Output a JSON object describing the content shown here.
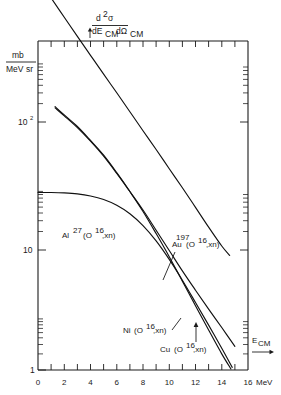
{
  "chart_data": {
    "type": "line",
    "title": "",
    "ylabel_numerator": "d²σ",
    "ylabel_denominator": "dE_CM dΩ_CM",
    "yunit_numerator": "mb",
    "yunit_denominator": "MeV·sr",
    "xlabel": "E_CM",
    "xunit": "MeV",
    "xlim": [
      0,
      16
    ],
    "ylim": [
      1,
      1000
    ],
    "yscale": "log",
    "xscale": "linear",
    "grid": false,
    "legend_position": "inline-annotations",
    "xticks_major": [
      0,
      2,
      4,
      6,
      8,
      10,
      12,
      14,
      16
    ],
    "xticks_minor": [
      1,
      3,
      5,
      7,
      9,
      11,
      13,
      15
    ],
    "xtick_labels": [
      "0",
      "2",
      "4",
      "6",
      "8",
      "10",
      "12",
      "14",
      "16"
    ],
    "ytick_labels": [
      "1",
      "10",
      "10²"
    ],
    "ytick_values": [
      1,
      10,
      100
    ],
    "series": [
      {
        "name": "Au197(O16,xn)",
        "label_base": "Au",
        "label_sup_pre": "197",
        "label_rest": "(O",
        "label_sup_mid": "16",
        "label_tail": ",xn)",
        "points": [
          [
            1.0,
            1000
          ],
          [
            2.0,
            700
          ],
          [
            3.0,
            490
          ],
          [
            4.0,
            345
          ],
          [
            5.0,
            243
          ],
          [
            6.0,
            172
          ],
          [
            7.0,
            121
          ],
          [
            8.0,
            85
          ],
          [
            9.0,
            60
          ],
          [
            10.0,
            42
          ],
          [
            11.0,
            29.5
          ],
          [
            12.0,
            20.5
          ],
          [
            13.0,
            14.2
          ],
          [
            14.0,
            10.0
          ],
          [
            14.6,
            8.4
          ]
        ]
      },
      {
        "name": "Al27(O16,xn)",
        "label_base": "Al",
        "label_sup_pre": "27",
        "label_rest": "(O",
        "label_sup_mid": "16",
        "label_tail": ",xn)",
        "points": [
          [
            0.0,
            27.0
          ],
          [
            1.0,
            27.0
          ],
          [
            2.0,
            26.8
          ],
          [
            3.0,
            26.3
          ],
          [
            4.0,
            25.3
          ],
          [
            5.0,
            23.7
          ],
          [
            6.0,
            21.3
          ],
          [
            7.0,
            18.2
          ],
          [
            8.0,
            14.6
          ],
          [
            9.0,
            11.0
          ],
          [
            10.0,
            7.8
          ],
          [
            11.0,
            5.3
          ],
          [
            12.0,
            3.5
          ],
          [
            13.0,
            2.3
          ],
          [
            14.0,
            1.5
          ],
          [
            14.8,
            1.05
          ]
        ]
      },
      {
        "name": "Ni(O16,xn)",
        "label_base": "Ni",
        "label_sup_pre": "",
        "label_rest": "(O",
        "label_sup_mid": "16",
        "label_tail": ",xn)",
        "points": [
          [
            1.3,
            133
          ],
          [
            2.0,
            114
          ],
          [
            3.0,
            92
          ],
          [
            4.0,
            71
          ],
          [
            5.0,
            54
          ],
          [
            6.0,
            39
          ],
          [
            7.0,
            27.5
          ],
          [
            8.0,
            19.0
          ],
          [
            9.0,
            12.6
          ],
          [
            10.0,
            8.2
          ],
          [
            11.0,
            5.2
          ],
          [
            12.0,
            3.3
          ],
          [
            13.0,
            2.1
          ],
          [
            14.0,
            1.35
          ],
          [
            14.7,
            1.02
          ]
        ]
      },
      {
        "name": "Cu(O16,xn)",
        "label_base": "Cu",
        "label_sup_pre": "",
        "label_rest": "(O",
        "label_sup_mid": "16",
        "label_tail": ",xn)",
        "points": [
          [
            1.3,
            130
          ],
          [
            2.0,
            112
          ],
          [
            3.0,
            90
          ],
          [
            4.0,
            70
          ],
          [
            5.0,
            53
          ],
          [
            6.0,
            38.5
          ],
          [
            7.0,
            27.5
          ],
          [
            8.0,
            19.5
          ],
          [
            9.0,
            13.4
          ],
          [
            10.0,
            9.2
          ],
          [
            11.0,
            6.3
          ],
          [
            12.0,
            4.4
          ],
          [
            13.0,
            3.1
          ],
          [
            14.0,
            2.2
          ],
          [
            15.0,
            1.55
          ]
        ]
      }
    ]
  },
  "annotations": {
    "au_label": {
      "base": "Au",
      "sup_pre": "197",
      "open": "(O",
      "sup_mid": "16",
      "tail": ",xn)"
    },
    "al_label": {
      "base": "Al",
      "sup_pre": "27",
      "open": "(O",
      "sup_mid": "16",
      "tail": ",xn)"
    },
    "ni_label": {
      "base": "Ni",
      "open": "(O",
      "sup_mid": "16",
      "tail": ",xn)"
    },
    "cu_label": {
      "base": "Cu",
      "open": "(O",
      "sup_mid": "16",
      "tail": ",xn)"
    }
  },
  "axis": {
    "y_numer": "d",
    "y_numer_sup": "2",
    "y_numer_sigma": "σ",
    "y_denom_a": "dE",
    "y_denom_a_sub": "CM",
    "y_denom_b": "dΩ",
    "y_denom_b_sub": "CM",
    "unit_top": "mb",
    "unit_bot_a": "MeV",
    "unit_bot_b": "sr",
    "x_title": "E",
    "x_title_sub": "CM",
    "x_unit": "MeV",
    "y_label_1": "1",
    "y_label_10": "10",
    "y_label_100_base": "10",
    "y_label_100_sup": "2"
  }
}
